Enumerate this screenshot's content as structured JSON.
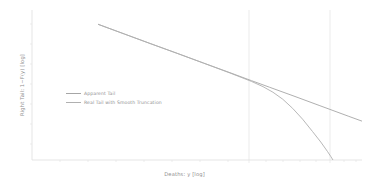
{
  "figure": {
    "background_color": "#ffffff",
    "axis_color": "#d8d8d8",
    "text_color": "#8f8f8f"
  },
  "chart_data": {
    "type": "line",
    "title": "",
    "xlabel": "Deaths: y [log]",
    "ylabel": "Right Tail: 1−F(y) [log]",
    "grid": false,
    "legend_position": "center-left",
    "xlim": [
      0,
      1
    ],
    "ylim": [
      0,
      1
    ],
    "xticks": [],
    "xticklabels": [
      "",
      ""
    ],
    "yticks": [],
    "yticklabels": [],
    "annotations": [
      {
        "name": "reference-line-1",
        "type": "vline",
        "x": 0.665,
        "color": "#dcdcdc"
      },
      {
        "name": "reference-line-2",
        "type": "vline",
        "x": 0.912,
        "color": "#dcdcdc"
      }
    ],
    "series": [
      {
        "name": "Apparent Tail",
        "color": "#a6a6a6",
        "linestyle": "solid",
        "x": [
          0.2,
          0.28,
          0.36,
          0.44,
          0.52,
          0.6,
          0.665,
          0.72,
          0.8,
          0.87,
          0.912,
          0.96,
          1.0
        ],
        "y": [
          0.905,
          0.84,
          0.775,
          0.711,
          0.646,
          0.582,
          0.529,
          0.485,
          0.421,
          0.364,
          0.33,
          0.291,
          0.259
        ]
      },
      {
        "name": "Real Tail with Smooth Truncation",
        "color": "#b0b0b0",
        "linestyle": "solid",
        "x": [
          0.2,
          0.28,
          0.36,
          0.44,
          0.52,
          0.6,
          0.665,
          0.7,
          0.73,
          0.76,
          0.79,
          0.82,
          0.85,
          0.875,
          0.895,
          0.905,
          0.912
        ],
        "y": [
          0.905,
          0.84,
          0.775,
          0.711,
          0.646,
          0.58,
          0.524,
          0.489,
          0.452,
          0.405,
          0.344,
          0.272,
          0.19,
          0.12,
          0.058,
          0.025,
          0.0
        ]
      }
    ]
  },
  "legend": {
    "entries": [
      {
        "label": "Apparent Tail",
        "color": "#a6a6a6"
      },
      {
        "label": "Real Tail with Smooth Truncation",
        "color": "#b0b0b0"
      }
    ]
  }
}
